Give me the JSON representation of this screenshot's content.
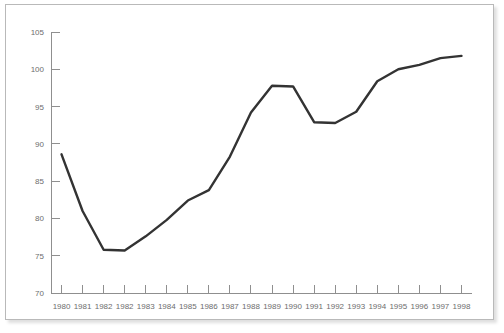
{
  "chart_data": {
    "type": "line",
    "title": "",
    "subtitle": "",
    "xlabel": "",
    "ylabel": "",
    "categories": [
      "1980",
      "1981",
      "1982",
      "1982",
      "1983",
      "1984",
      "1985",
      "1986",
      "1987",
      "1988",
      "1989",
      "1990",
      "1991",
      "1992",
      "1993",
      "1994",
      "1995",
      "1996",
      "1997",
      "1998"
    ],
    "values": [
      88.6,
      81.0,
      75.8,
      75.7,
      77.6,
      79.8,
      82.4,
      83.8,
      88.3,
      94.2,
      97.8,
      97.7,
      92.9,
      92.8,
      94.3,
      98.4,
      100.0,
      100.6,
      101.5,
      101.8
    ],
    "series": [
      {
        "name": "series-1",
        "values": [
          88.6,
          81.0,
          75.8,
          75.7,
          77.6,
          79.8,
          82.4,
          83.8,
          88.3,
          94.2,
          97.8,
          97.7,
          92.9,
          92.8,
          94.3,
          98.4,
          100.0,
          100.6,
          101.5,
          101.8
        ]
      }
    ],
    "ylim": [
      70,
      105
    ],
    "yticks": [
      70,
      75,
      80,
      85,
      90,
      95,
      100,
      105
    ],
    "ytick_labels": [
      "70",
      "75",
      "80",
      "85",
      "90",
      "95",
      "100",
      "105"
    ],
    "xtick_labels": [
      "1980",
      "1981",
      "1982",
      "1982",
      "1983",
      "1984",
      "1985",
      "1986",
      "1987",
      "1988",
      "1989",
      "1990",
      "1991",
      "1992",
      "1993",
      "1994",
      "1995",
      "1996",
      "1997",
      "1998"
    ],
    "grid": false,
    "legend": false,
    "legend_position": "none",
    "line_color": "#333333",
    "axis_color": "#8f8f8f",
    "label_color": "#6d6d6d",
    "background_color": "#ffffff",
    "border_color": "#b9b9b9"
  }
}
